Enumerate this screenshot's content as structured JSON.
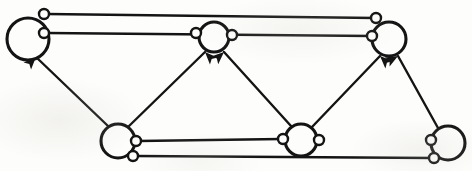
{
  "figure": {
    "kind": "directed-graph-diagram",
    "title": "",
    "caption": "",
    "background_color": "#fdfdfb",
    "ink_color": "#141414",
    "width": 472,
    "height": 171
  },
  "graph": {
    "node_count": 6,
    "edge_count": 9,
    "directed": true,
    "source_marker": "small-open-circle",
    "target_marker": "solid-arrowhead",
    "nodes": [
      {
        "id": "n1",
        "name": "top-left-node",
        "cx": 28,
        "cy": 39,
        "r": 21
      },
      {
        "id": "n2",
        "name": "top-middle-node",
        "cx": 214,
        "cy": 37,
        "r": 15
      },
      {
        "id": "n3",
        "name": "top-right-node",
        "cx": 389,
        "cy": 39,
        "r": 17
      },
      {
        "id": "n4",
        "name": "bottom-left-node",
        "cx": 118,
        "cy": 141,
        "r": 17
      },
      {
        "id": "n5",
        "name": "bottom-middle-node",
        "cx": 301,
        "cy": 140,
        "r": 16
      },
      {
        "id": "n6",
        "name": "bottom-right-node",
        "cx": 448,
        "cy": 143,
        "r": 17
      }
    ],
    "edges": [
      {
        "id": "e1",
        "name": "edge-top-left-to-top-right-upper",
        "from": "n1",
        "to": "n3",
        "source_port": {
          "x": 44,
          "y": 14
        },
        "target_port": {
          "x": 376,
          "y": 18
        },
        "arrow": false,
        "path": "M 47 14 L 375 18"
      },
      {
        "id": "e2",
        "name": "edge-top-left-to-top-middle",
        "from": "n1",
        "to": "n3",
        "source_port": {
          "x": 44,
          "y": 33
        },
        "target_port": {
          "x": 372,
          "y": 36
        },
        "arrow": false,
        "path": "M 47 33 L 371 36"
      },
      {
        "id": "e3",
        "name": "edge-bottom-left-to-top-left",
        "from": "n4",
        "to": "n1",
        "source_port": null,
        "target_port": null,
        "arrow": true,
        "path": "M 108 126 L 36 57"
      },
      {
        "id": "e4",
        "name": "edge-bottom-left-to-top-middle",
        "from": "n4",
        "to": "n2",
        "source_port": null,
        "target_port": null,
        "arrow": true,
        "path": "M 128 127 L 205 52"
      },
      {
        "id": "e5",
        "name": "edge-bottom-middle-to-top-middle",
        "from": "n5",
        "to": "n2",
        "source_port": null,
        "target_port": null,
        "arrow": true,
        "path": "M 291 126 L 224 52"
      },
      {
        "id": "e6",
        "name": "edge-bottom-middle-to-top-right",
        "from": "n5",
        "to": "n3",
        "source_port": null,
        "target_port": null,
        "arrow": true,
        "path": "M 312 127 L 380 56"
      },
      {
        "id": "e7",
        "name": "edge-bottom-right-to-top-right",
        "from": "n6",
        "to": "n3",
        "source_port": null,
        "target_port": null,
        "arrow": true,
        "path": "M 438 128 L 398 56"
      },
      {
        "id": "e8",
        "name": "edge-bottom-left-to-bottom-middle",
        "from": "n4",
        "to": "n5",
        "source_port": {
          "x": 136,
          "y": 141
        },
        "target_port": {
          "x": 283,
          "y": 139
        },
        "arrow": false,
        "path": "M 139 141 L 281 139"
      },
      {
        "id": "e9",
        "name": "edge-bottom-left-to-bottom-right",
        "from": "n4",
        "to": "n6",
        "source_port": {
          "x": 133,
          "y": 156
        },
        "target_port": {
          "x": 434,
          "y": 158
        },
        "arrow": false,
        "path": "M 136 156 L 433 158"
      }
    ],
    "ports": [
      {
        "id": "p1",
        "name": "port-top-left-upper",
        "x": 44,
        "y": 14,
        "r": 5
      },
      {
        "id": "p2",
        "name": "port-top-left-lower",
        "x": 44,
        "y": 33,
        "r": 5
      },
      {
        "id": "p3",
        "name": "port-top-middle-left",
        "x": 196,
        "y": 33,
        "r": 5
      },
      {
        "id": "p4",
        "name": "port-top-middle-right",
        "x": 232,
        "y": 35,
        "r": 5
      },
      {
        "id": "p5",
        "name": "port-top-right-upper",
        "x": 376,
        "y": 18,
        "r": 5
      },
      {
        "id": "p6",
        "name": "port-top-right-lower",
        "x": 372,
        "y": 36,
        "r": 5
      },
      {
        "id": "p7",
        "name": "port-bottom-left-right",
        "x": 136,
        "y": 141,
        "r": 5
      },
      {
        "id": "p8",
        "name": "port-bottom-left-lower",
        "x": 133,
        "y": 156,
        "r": 5
      },
      {
        "id": "p9",
        "name": "port-bottom-middle-left",
        "x": 283,
        "y": 139,
        "r": 5
      },
      {
        "id": "p10",
        "name": "port-bottom-middle-right",
        "x": 319,
        "y": 140,
        "r": 5
      },
      {
        "id": "p11",
        "name": "port-bottom-right-left",
        "x": 431,
        "y": 140,
        "r": 5
      },
      {
        "id": "p12",
        "name": "port-bottom-right-lower",
        "x": 434,
        "y": 158,
        "r": 5
      }
    ],
    "arrowheads": [
      {
        "id": "a1",
        "name": "arrowhead-into-top-left",
        "x": 36,
        "y": 57,
        "angle": 44
      },
      {
        "id": "a2",
        "name": "arrowhead-into-top-middle-left",
        "x": 205,
        "y": 52,
        "angle": -44
      },
      {
        "id": "a3",
        "name": "arrowhead-into-top-middle-right",
        "x": 224,
        "y": 52,
        "angle": 48
      },
      {
        "id": "a4",
        "name": "arrowhead-into-top-right-left",
        "x": 380,
        "y": 56,
        "angle": -46
      },
      {
        "id": "a5",
        "name": "arrowhead-into-top-right-right",
        "x": 398,
        "y": 56,
        "angle": 61
      }
    ]
  }
}
